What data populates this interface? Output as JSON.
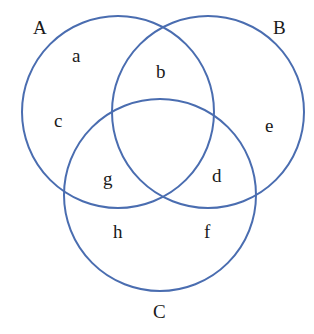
{
  "diagram": {
    "type": "venn",
    "stroke_color": "#4a6db0",
    "circles": [
      {
        "name": "A",
        "cx": 118,
        "cy": 112,
        "r": 96,
        "label_x": 33,
        "label_y": 34
      },
      {
        "name": "B",
        "cx": 208,
        "cy": 112,
        "r": 96,
        "label_x": 273,
        "label_y": 34
      },
      {
        "name": "C",
        "cx": 160,
        "cy": 195,
        "r": 96,
        "label_x": 153,
        "label_y": 318
      }
    ],
    "regions": [
      {
        "label": "a",
        "x": 72,
        "y": 62
      },
      {
        "label": "b",
        "x": 156,
        "y": 78
      },
      {
        "label": "c",
        "x": 54,
        "y": 127
      },
      {
        "label": "e",
        "x": 265,
        "y": 132
      },
      {
        "label": "g",
        "x": 103,
        "y": 185
      },
      {
        "label": "d",
        "x": 212,
        "y": 182
      },
      {
        "label": "h",
        "x": 113,
        "y": 238
      },
      {
        "label": "f",
        "x": 204,
        "y": 238
      }
    ]
  }
}
